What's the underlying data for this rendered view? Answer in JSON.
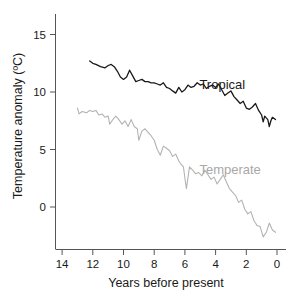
{
  "chart_data": {
    "type": "line",
    "title": "",
    "xlabel": "Years before present",
    "ylabel": "Temperature anomaly (ºC)",
    "xlim": [
      14.5,
      -0.3
    ],
    "ylim": [
      -4,
      16.5
    ],
    "x_ticks": [
      14,
      12,
      10,
      8,
      6,
      4,
      2,
      0
    ],
    "y_ticks": [
      15,
      10,
      5,
      0
    ],
    "x_reversed": true,
    "grid": false,
    "legend": "inline labels",
    "series": [
      {
        "name": "Tropical",
        "color": "#1a1a1a",
        "label_pos": [
          3.1,
          10.6
        ],
        "x": [
          12.2,
          12.0,
          11.8,
          11.5,
          11.2,
          11.0,
          10.8,
          10.6,
          10.4,
          10.2,
          10.0,
          9.8,
          9.6,
          9.4,
          9.2,
          9.0,
          8.8,
          8.6,
          8.4,
          8.2,
          8.0,
          7.8,
          7.6,
          7.4,
          7.2,
          7.0,
          6.8,
          6.6,
          6.4,
          6.2,
          6.0,
          5.8,
          5.6,
          5.4,
          5.2,
          5.0,
          4.8,
          4.6,
          4.4,
          4.2,
          4.0,
          3.8,
          3.6,
          3.4,
          3.2,
          3.0,
          2.8,
          2.6,
          2.4,
          2.2,
          2.0,
          1.8,
          1.6,
          1.4,
          1.2,
          1.0,
          0.9,
          0.8,
          0.6,
          0.5,
          0.4,
          0.3,
          0.1
        ],
        "y": [
          12.7,
          12.5,
          12.4,
          12.2,
          12.1,
          12.3,
          12.4,
          12.2,
          11.8,
          11.3,
          11.1,
          11.3,
          11.9,
          11.4,
          10.9,
          11.0,
          11.1,
          10.9,
          10.9,
          10.8,
          10.8,
          10.7,
          10.6,
          10.8,
          10.4,
          10.3,
          10.1,
          9.9,
          10.4,
          10.0,
          10.2,
          10.6,
          10.4,
          10.5,
          10.8,
          10.6,
          10.7,
          10.3,
          10.5,
          10.6,
          10.4,
          10.7,
          10.2,
          9.7,
          9.9,
          10.1,
          9.6,
          9.3,
          9.0,
          9.2,
          8.6,
          8.5,
          8.7,
          9.0,
          8.4,
          8.0,
          7.4,
          7.9,
          7.6,
          7.0,
          7.5,
          7.8,
          7.6
        ]
      },
      {
        "name": "Temperate",
        "color": "#b3b3b3",
        "label_pos": [
          3.1,
          3.3
        ],
        "x": [
          13.0,
          12.9,
          12.7,
          12.4,
          12.2,
          12.0,
          11.8,
          11.6,
          11.4,
          11.2,
          11.0,
          10.9,
          10.7,
          10.5,
          10.3,
          10.1,
          9.9,
          9.7,
          9.5,
          9.3,
          9.1,
          9.0,
          8.8,
          8.6,
          8.4,
          8.2,
          8.0,
          7.8,
          7.6,
          7.4,
          7.2,
          7.0,
          6.8,
          6.6,
          6.4,
          6.3,
          6.1,
          6.0,
          5.9,
          5.7,
          5.5,
          5.3,
          5.1,
          4.9,
          4.7,
          4.5,
          4.3,
          4.1,
          3.9,
          3.7,
          3.5,
          3.3,
          3.1,
          2.9,
          2.7,
          2.5,
          2.3,
          2.1,
          1.9,
          1.7,
          1.5,
          1.3,
          1.1,
          0.9,
          0.7,
          0.5,
          0.3,
          0.1
        ],
        "y": [
          8.6,
          8.1,
          8.3,
          8.2,
          8.4,
          8.3,
          8.4,
          8.0,
          8.1,
          7.8,
          7.9,
          7.2,
          7.6,
          7.9,
          7.6,
          7.2,
          7.5,
          7.0,
          7.6,
          7.0,
          6.8,
          5.8,
          6.6,
          6.8,
          6.5,
          6.2,
          5.8,
          5.0,
          4.5,
          5.3,
          5.1,
          4.9,
          4.4,
          4.6,
          4.0,
          3.8,
          3.5,
          2.5,
          1.6,
          3.5,
          3.2,
          2.9,
          3.0,
          2.7,
          3.2,
          2.8,
          2.4,
          2.6,
          2.0,
          2.4,
          2.8,
          2.2,
          1.6,
          1.3,
          1.0,
          0.4,
          0.6,
          -0.2,
          -0.6,
          -0.4,
          -1.2,
          -1.6,
          -1.7,
          -2.6,
          -2.2,
          -1.4,
          -2.0,
          -2.2
        ]
      }
    ]
  },
  "labels": {
    "tropical": "Tropical",
    "temperate": "Temperate",
    "xlabel": "Years before present",
    "ylabel": "Temperature anomaly (ºC)"
  },
  "colors": {
    "axis": "#555555",
    "tropical": "#1a1a1a",
    "temperate": "#b3b3b3",
    "text": "#1a1a1a"
  }
}
